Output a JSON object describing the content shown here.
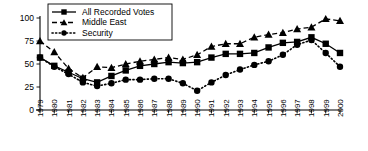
{
  "chart_data": {
    "type": "line",
    "title": "",
    "xlabel": "",
    "ylabel": "",
    "ylim": [
      0,
      100
    ],
    "yticks": [
      0,
      25,
      50,
      75,
      100
    ],
    "grid": false,
    "legend_position": "top-center",
    "x": [
      "1979",
      "1980",
      "1981",
      "1982",
      "1983",
      "1984",
      "1985",
      "1986",
      "1987",
      "1988",
      "1989",
      "1990",
      "1991",
      "1992",
      "1993",
      "1994",
      "1995",
      "1996",
      "1997",
      "1998",
      "1999",
      "2000"
    ],
    "series": [
      {
        "name": "All Recorded Votes",
        "marker": "square",
        "line": "solid",
        "color": "#000000",
        "values": [
          57,
          48,
          41,
          34,
          30,
          37,
          43,
          48,
          50,
          52,
          51,
          52,
          57,
          61,
          61,
          62,
          68,
          73,
          74,
          79,
          72,
          62
        ]
      },
      {
        "name": "Middle East",
        "marker": "triangle",
        "line": "dashed",
        "color": "#000000",
        "values": [
          75,
          63,
          45,
          35,
          47,
          46,
          50,
          53,
          55,
          57,
          55,
          60,
          69,
          72,
          72,
          79,
          82,
          84,
          88,
          90,
          99,
          97
        ]
      },
      {
        "name": "Security",
        "marker": "circle",
        "line": "dotted",
        "color": "#000000",
        "values": [
          57,
          47,
          39,
          30,
          26,
          29,
          33,
          33,
          34,
          34,
          29,
          21,
          30,
          38,
          44,
          49,
          53,
          60,
          71,
          76,
          62,
          47
        ]
      }
    ]
  },
  "legend": {
    "items": [
      {
        "label": "All Recorded Votes"
      },
      {
        "label": "Middle East"
      },
      {
        "label": "Security"
      }
    ]
  }
}
